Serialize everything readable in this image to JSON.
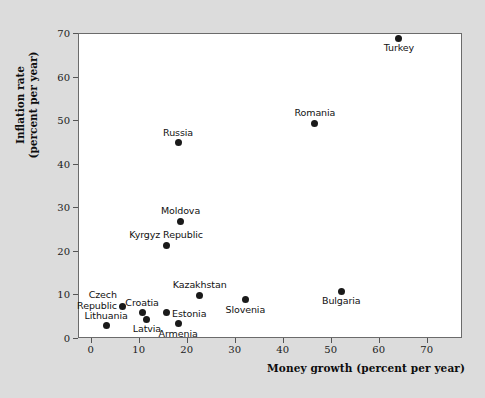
{
  "chart_data": {
    "type": "scatter",
    "title": "",
    "xlabel": "Money growth (percent per year)",
    "ylabel": "Inflation rate\n(percent per year)",
    "ylabel_line1": "Inflation rate",
    "ylabel_line2": "(percent per year)",
    "xlim": [
      0,
      78
    ],
    "ylim": [
      0,
      70
    ],
    "xticks": [
      0,
      10,
      20,
      30,
      40,
      50,
      60,
      70
    ],
    "yticks": [
      0,
      10,
      20,
      30,
      40,
      50,
      60,
      70
    ],
    "grid": false,
    "legend": false,
    "points": [
      {
        "label": "Turkey",
        "x": 64.0,
        "y": 69.0,
        "label_pos": "below"
      },
      {
        "label": "Romania",
        "x": 46.5,
        "y": 49.5,
        "label_pos": "above"
      },
      {
        "label": "Russia",
        "x": 18.0,
        "y": 45.0,
        "label_pos": "above"
      },
      {
        "label": "Moldova",
        "x": 18.5,
        "y": 27.0,
        "label_pos": "above"
      },
      {
        "label": "Kyrgyz Republic",
        "x": 15.5,
        "y": 21.5,
        "label_pos": "above"
      },
      {
        "label": "Kazakhstan",
        "x": 22.5,
        "y": 10.0,
        "label_pos": "above"
      },
      {
        "label": "Bulgaria",
        "x": 52.0,
        "y": 11.0,
        "label_pos": "below"
      },
      {
        "label": "Slovenia",
        "x": 32.0,
        "y": 9.0,
        "label_pos": "below"
      },
      {
        "label": "Czech Republic",
        "x": 6.5,
        "y": 7.5,
        "label_pos": "left-two-line"
      },
      {
        "label": "Croatia",
        "x": 10.5,
        "y": 6.0,
        "label_pos": "above"
      },
      {
        "label": "Estonia",
        "x": 15.5,
        "y": 6.0,
        "label_pos": "right"
      },
      {
        "label": "Latvia",
        "x": 11.5,
        "y": 4.5,
        "label_pos": "below"
      },
      {
        "label": "Armenia",
        "x": 18.0,
        "y": 3.5,
        "label_pos": "below"
      },
      {
        "label": "Lithuania",
        "x": 3.0,
        "y": 3.0,
        "label_pos": "above"
      }
    ]
  },
  "axes": {
    "x_title": "Money growth (percent per year)",
    "y_title_line1": "Inflation rate",
    "y_title_line2": "(percent per year)"
  },
  "colors": {
    "background": "#dcdcdc",
    "plot_background": "#ffffff",
    "point": "#1a1a1a",
    "frame": "#6b6b6b",
    "text": "#111111"
  }
}
